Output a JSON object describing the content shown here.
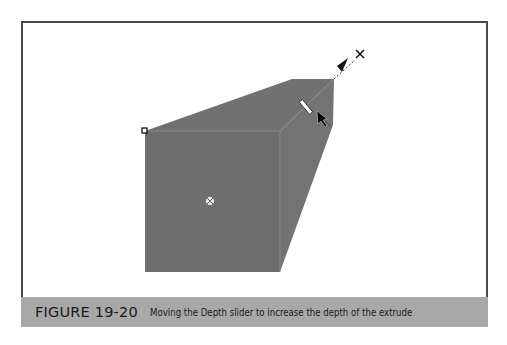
{
  "figure": {
    "label": "FIGURE 19-20",
    "caption": "Moving the Depth slider to increase the depth of the extrude"
  },
  "colors": {
    "shape_fill": "#6f6f6f",
    "shape_side": "#747474",
    "frame_border": "#4a4a4a",
    "caption_bar": "#a8a8a8",
    "caption_text": "#1a1a1a"
  },
  "shape": {
    "front_face": {
      "x": 145,
      "y": 131,
      "width": 135,
      "height": 141
    },
    "vanishing_point": {
      "x": 360,
      "y": 55
    },
    "center_marker": {
      "x": 210,
      "y": 201
    }
  }
}
